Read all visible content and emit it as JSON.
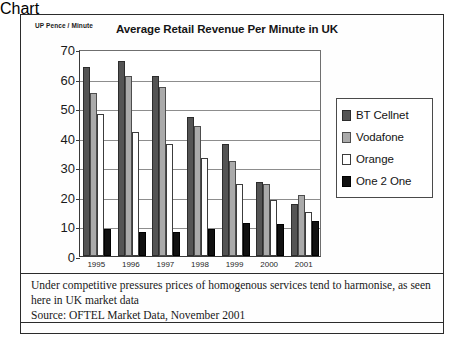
{
  "chart_data": {
    "type": "bar",
    "title": "Average Retail Revenue Per Minute in UK",
    "ylabel": "UP Pence / Minute",
    "xlabel": "",
    "categories": [
      "1995",
      "1996",
      "1997",
      "1998",
      "1999",
      "2000",
      "2001"
    ],
    "series": [
      {
        "name": "BT Cellnet",
        "color": "#545454",
        "values": [
          64,
          66,
          61,
          47,
          38,
          25,
          17.5
        ]
      },
      {
        "name": "Vodafone",
        "color": "#aaaaaa",
        "values": [
          55,
          61,
          57,
          44,
          32,
          24.5,
          20.5
        ]
      },
      {
        "name": "Orange",
        "color": "#ffffff",
        "values": [
          48,
          42,
          38,
          33,
          24.5,
          19,
          15
        ]
      },
      {
        "name": "One 2 One",
        "color": "#111111",
        "values": [
          9,
          8,
          8,
          9,
          11,
          10.7,
          12
        ]
      }
    ],
    "ylim": [
      0,
      70
    ],
    "yticks": [
      0,
      10,
      20,
      30,
      40,
      50,
      60,
      70
    ],
    "grid": true,
    "legend_position": "right"
  },
  "caption": {
    "note": "Under competitive pressures prices of homogenous services tend to harmonise, as seen here in UK market data",
    "source": "Source: OFTEL Market Data, November 2001"
  }
}
